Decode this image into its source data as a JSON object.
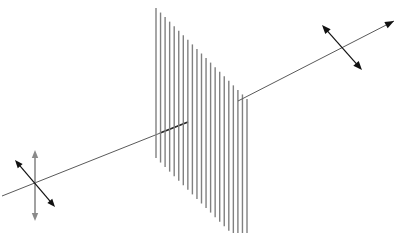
{
  "figure": {
    "caption": "",
    "width": 403,
    "height": 233,
    "background_color": "#ffffff"
  },
  "colors": {
    "beam": "#5a5a5a",
    "grating_line": "#808080",
    "arrow_black": "#111111",
    "arrow_gray": "#8a8a8a",
    "incident_stub": "#2b2b2b"
  },
  "beam": {
    "label": "light-propagation-axis",
    "incident": {
      "label": "incident unpolarized beam",
      "x1": 2,
      "y1": 196,
      "x2": 188,
      "y2": 122,
      "stroke_width": 1.0
    },
    "incident_stub": {
      "label": "beam segment inside filter",
      "x1": 160,
      "y1": 133,
      "x2": 188,
      "y2": 122,
      "stroke_width": 1.6
    },
    "transmitted": {
      "label": "transmitted polarized beam",
      "x1": 238,
      "y1": 101,
      "x2": 394,
      "y2": 21,
      "stroke_width": 1.0,
      "arrowhead": {
        "x": 394,
        "y": 21,
        "size": 9
      }
    }
  },
  "filter": {
    "label": "vertical polarizing filter",
    "orientation": "vertical slits",
    "line_count": 21,
    "top_left": {
      "x": 156,
      "y": 8
    },
    "top_right": {
      "x": 247,
      "y": 99
    },
    "slat_height": 150,
    "x_start": 156,
    "x_end": 247,
    "y_start": 8,
    "y_end": 99,
    "stroke_width": 1.4
  },
  "polarization_unpolarized": {
    "label": "unpolarized oscillation directions",
    "center": {
      "x": 35,
      "y": 183
    },
    "arrows": [
      {
        "name": "vertical-double-arrow",
        "color": "gray",
        "x1": 35,
        "y1": 150,
        "x2": 35,
        "y2": 221,
        "head_size": 8
      },
      {
        "name": "diagonal-double-arrow",
        "color": "black",
        "x1": 15,
        "y1": 160,
        "x2": 55,
        "y2": 207,
        "head_size": 8
      }
    ]
  },
  "polarization_polarized": {
    "label": "linear polarization direction after filter",
    "center": {
      "x": 343,
      "y": 47
    },
    "arrows": [
      {
        "name": "linear-double-arrow",
        "color": "black",
        "x1": 322,
        "y1": 25,
        "x2": 362,
        "y2": 70,
        "head_size": 9
      }
    ]
  }
}
